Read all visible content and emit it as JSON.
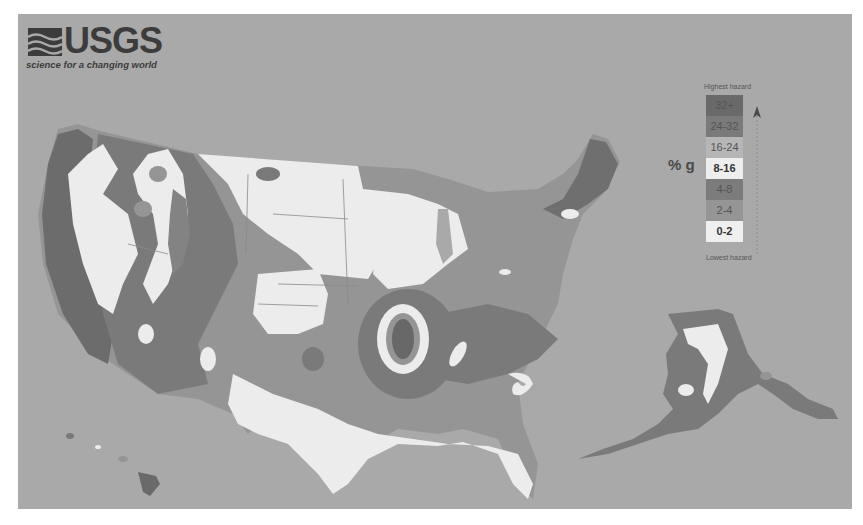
{
  "logo": {
    "name": "USGS",
    "tagline": "science for a changing world"
  },
  "legend": {
    "top_label": "Highest hazard",
    "bottom_label": "Lowest hazard",
    "unit_label": "% g",
    "classes": [
      {
        "label": "32+",
        "color": "#6a6a6a"
      },
      {
        "label": "24-32",
        "color": "#7a7a7a"
      },
      {
        "label": "16-24",
        "color": "#b6b6b6"
      },
      {
        "label": "8-16",
        "color": "#eeeeee"
      },
      {
        "label": "4-8",
        "color": "#7c7c7c"
      },
      {
        "label": "2-4",
        "color": "#959595"
      },
      {
        "label": "0-2",
        "color": "#efefef"
      }
    ]
  },
  "map": {
    "background_color": "#a9a9a9",
    "regions": [
      "Contiguous United States",
      "Alaska",
      "Hawaii"
    ]
  }
}
